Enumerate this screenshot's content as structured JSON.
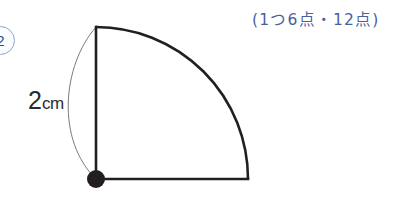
{
  "page": {
    "background_color": "#ffffff",
    "width": 408,
    "height": 201
  },
  "problem_badge": {
    "number": "2",
    "border_color": "#8aa8cf",
    "text_color": "#2f4f86"
  },
  "score_note": {
    "text": "(1つ6点・12点)",
    "color": "#4a5f9e"
  },
  "figure": {
    "name": "quarter-circle-sector",
    "stroke_color": "#231f1f",
    "stroke_width": 2.6,
    "thin_stroke_color": "#6b6b6b",
    "thin_stroke_width": 0.9,
    "center_point": {
      "x": 96,
      "y": 179
    },
    "top_point": {
      "x": 96,
      "y": 27
    },
    "right_point": {
      "x": 248,
      "y": 179
    },
    "radius": 152,
    "vertex_dot_radius": 9,
    "vertex_dot_color": "#231f1f"
  },
  "dimension_label": {
    "value": "2",
    "unit": "cm",
    "color": "#2b2b2b"
  }
}
